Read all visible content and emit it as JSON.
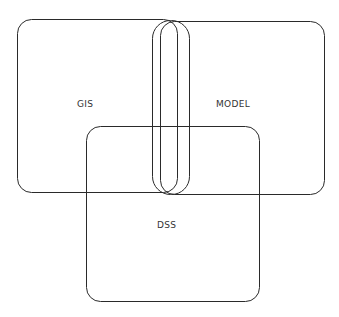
{
  "diagram": {
    "type": "overlapping-sets",
    "stroke_color": "#2a2a2a",
    "background": "#ffffff",
    "sets": [
      {
        "id": "gis",
        "label": "GIS"
      },
      {
        "id": "model",
        "label": "MODEL"
      },
      {
        "id": "dss",
        "label": "DSS"
      }
    ]
  }
}
